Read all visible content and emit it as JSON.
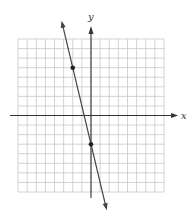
{
  "chart_data": {
    "type": "line",
    "title": "",
    "xlabel": "x",
    "ylabel": "y",
    "xlim": [
      -8,
      8
    ],
    "ylim": [
      -8,
      8
    ],
    "grid": true,
    "grid_step": 1,
    "series": [
      {
        "name": "line",
        "equation": "y = -4x - 3",
        "slope": -4,
        "intercept": -3,
        "points": [
          {
            "x": -2,
            "y": 5
          },
          {
            "x": 0,
            "y": -3
          }
        ]
      }
    ]
  },
  "labels": {
    "x_axis": "x",
    "y_axis": "y"
  },
  "colors": {
    "grid": "#c8c8c8",
    "axis": "#333333",
    "line": "#444444",
    "point": "#222222"
  }
}
